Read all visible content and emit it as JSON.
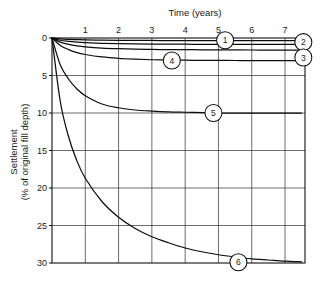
{
  "chart_data": {
    "type": "line",
    "title": "",
    "xlabel": "Time (years)",
    "ylabel": "Settlement (% of original fill depth)",
    "xlim": [
      0,
      7.6
    ],
    "ylim": [
      0,
      30
    ],
    "y_inverted": true,
    "grid": true,
    "legend_position": "inline-callouts",
    "x_ticks": [
      1,
      2,
      3,
      4,
      5,
      6,
      7
    ],
    "x_tick_labels": [
      "1",
      "2",
      "3",
      "4",
      "5",
      "6",
      "7"
    ],
    "y_ticks": [
      0,
      5,
      10,
      15,
      20,
      25,
      30
    ],
    "y_tick_labels": [
      "0",
      "5",
      "10",
      "15",
      "20",
      "25",
      "30"
    ],
    "x": [
      0,
      0.25,
      0.5,
      0.75,
      1,
      1.5,
      2,
      2.5,
      3,
      3.5,
      4,
      4.5,
      5,
      5.5,
      6,
      6.5,
      7,
      7.5
    ],
    "series": [
      {
        "name": "1",
        "label": "1",
        "final_settlement_pct": 0.35,
        "values": [
          0,
          0.12,
          0.18,
          0.22,
          0.25,
          0.29,
          0.31,
          0.32,
          0.33,
          0.34,
          0.34,
          0.35,
          0.35,
          0.35,
          0.35,
          0.35,
          0.35,
          0.35
        ]
      },
      {
        "name": "2",
        "label": "2",
        "final_settlement_pct": 0.85,
        "values": [
          0,
          0.3,
          0.45,
          0.55,
          0.62,
          0.71,
          0.76,
          0.79,
          0.81,
          0.82,
          0.83,
          0.84,
          0.84,
          0.85,
          0.85,
          0.85,
          0.85,
          0.85
        ]
      },
      {
        "name": "3",
        "label": "3",
        "final_settlement_pct": 1.6,
        "values": [
          0,
          0.55,
          0.85,
          1.05,
          1.18,
          1.34,
          1.43,
          1.49,
          1.52,
          1.55,
          1.56,
          1.57,
          1.58,
          1.59,
          1.6,
          1.6,
          1.6,
          1.6
        ]
      },
      {
        "name": "4",
        "label": "4",
        "final_settlement_pct": 3.0,
        "values": [
          0,
          1.0,
          1.55,
          1.95,
          2.2,
          2.53,
          2.72,
          2.83,
          2.9,
          2.94,
          2.96,
          2.98,
          2.99,
          3.0,
          3.0,
          3.0,
          3.0,
          3.0
        ]
      },
      {
        "name": "5",
        "label": "5",
        "final_settlement_pct": 10.0,
        "values": [
          0,
          3.6,
          5.5,
          6.8,
          7.7,
          8.8,
          9.3,
          9.6,
          9.75,
          9.85,
          9.9,
          9.95,
          10.0,
          10.0,
          10.0,
          10.0,
          10.0,
          10.0
        ]
      },
      {
        "name": "6",
        "label": "6",
        "final_settlement_pct": 30.0,
        "values": [
          0,
          8.5,
          13.2,
          16.4,
          18.7,
          21.8,
          23.9,
          25.4,
          26.5,
          27.3,
          28.0,
          28.5,
          28.9,
          29.2,
          29.45,
          29.6,
          29.75,
          29.85
        ]
      }
    ],
    "callouts": [
      {
        "label": "1",
        "series": "1",
        "x_years": 5.2,
        "settlement_pct": 0.3
      },
      {
        "label": "2",
        "series": "2",
        "x_years": 7.55,
        "settlement_pct": 0.55
      },
      {
        "label": "3",
        "series": "3",
        "x_years": 7.55,
        "settlement_pct": 2.6
      },
      {
        "label": "4",
        "series": "4",
        "x_years": 3.6,
        "settlement_pct": 3.0
      },
      {
        "label": "5",
        "series": "5",
        "x_years": 4.85,
        "settlement_pct": 10.0
      },
      {
        "label": "6",
        "series": "6",
        "x_years": 5.6,
        "settlement_pct": 29.9
      }
    ]
  },
  "colors": {
    "background": "#ffffff",
    "curve": "#0d0d0d",
    "grid": "#2b2b2b",
    "frame": "#111111",
    "text": "#1a1a1a"
  }
}
